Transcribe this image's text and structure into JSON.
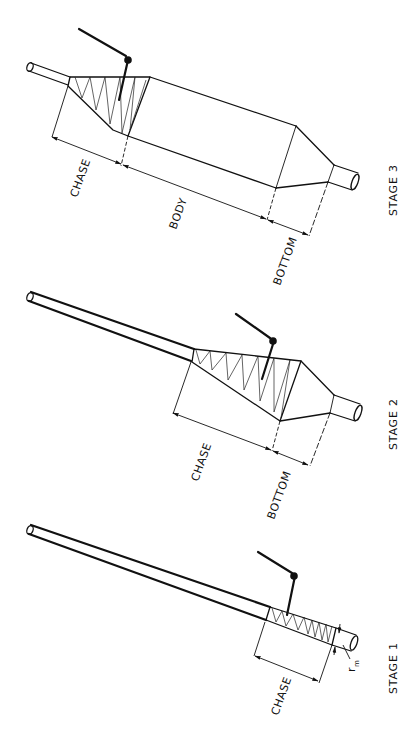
{
  "figure": {
    "line_color": "#111111",
    "background": "#ffffff"
  },
  "stages": [
    {
      "id": "stage-3",
      "title": "STAGE 3",
      "labels": {
        "chase": "CHASE",
        "body": "BODY",
        "bottom": "BOTTOM"
      }
    },
    {
      "id": "stage-2",
      "title": "STAGE 2",
      "labels": {
        "chase": "CHASE",
        "bottom": "BOTTOM"
      }
    },
    {
      "id": "stage-1",
      "title": "STAGE 1",
      "labels": {
        "chase": "CHASE",
        "radius_symbol": "r",
        "radius_subscript": "m"
      }
    }
  ]
}
